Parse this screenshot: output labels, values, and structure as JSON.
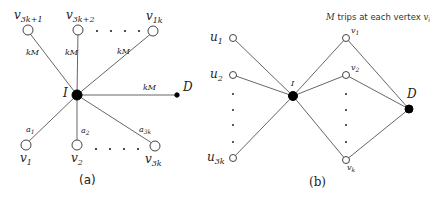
{
  "diagram_a": {
    "caption": "(a)",
    "hub": {
      "label": "I"
    },
    "destination": {
      "label": "D"
    },
    "top_nodes": [
      {
        "base": "v",
        "sub": "3k+1"
      },
      {
        "base": "v",
        "sub": "3k+2"
      },
      {
        "base": "v",
        "sub": "1k"
      }
    ],
    "bottom_nodes": [
      {
        "base": "v",
        "sub": "1"
      },
      {
        "base": "v",
        "sub": "2"
      },
      {
        "base": "v",
        "sub": "3k"
      }
    ],
    "top_edge_labels": [
      "kM",
      "kM",
      "kM"
    ],
    "destination_edge_label": "kM",
    "bottom_edge_labels": [
      {
        "base": "a",
        "sub": "1"
      },
      {
        "base": "a",
        "sub": "2"
      },
      {
        "base": "a",
        "sub": "3k"
      }
    ]
  },
  "diagram_b": {
    "caption": "(b)",
    "note": {
      "prefix": "M",
      "text": " trips at each vertex ",
      "var": "v",
      "sub": "i"
    },
    "hub": {
      "label": "I"
    },
    "destination": {
      "label": "D"
    },
    "left_nodes": [
      {
        "base": "u",
        "sub": "1"
      },
      {
        "base": "u",
        "sub": "2"
      },
      {
        "base": "u",
        "sub": "3k"
      }
    ],
    "right_nodes": [
      {
        "base": "v",
        "sub": "1"
      },
      {
        "base": "v",
        "sub": "2"
      },
      {
        "base": "v",
        "sub": "k"
      }
    ]
  }
}
